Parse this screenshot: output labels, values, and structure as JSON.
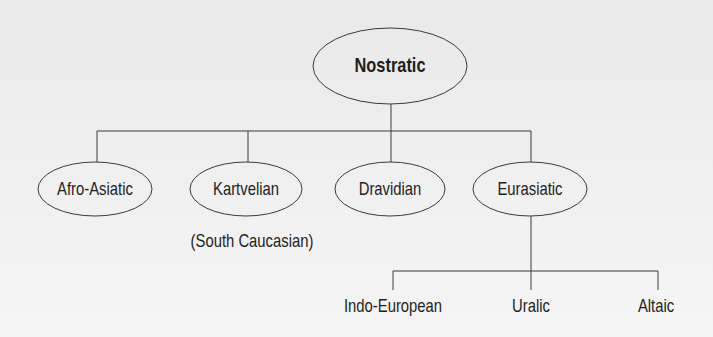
{
  "diagram": {
    "type": "language-family-tree",
    "root": {
      "label": "Nostratic"
    },
    "children": [
      {
        "label": "Afro-Asiatic"
      },
      {
        "label": "Kartvelian",
        "note": "(South Caucasian)"
      },
      {
        "label": "Dravidian"
      },
      {
        "label": "Eurasiatic",
        "children": [
          {
            "label": "Indo-European"
          },
          {
            "label": "Uralic"
          },
          {
            "label": "Altaic"
          }
        ]
      }
    ],
    "colors": {
      "line": "#3a3a3a",
      "text": "#1e1e1e",
      "background": "#efefef"
    }
  }
}
